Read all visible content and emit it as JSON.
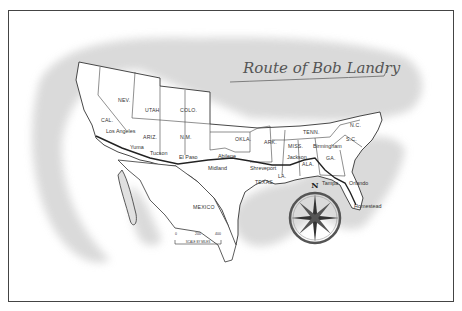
{
  "map": {
    "title": "Route of Bob Landry",
    "states": [
      {
        "label": "NEV.",
        "x": 118,
        "y": 102
      },
      {
        "label": "UTAH",
        "x": 145,
        "y": 112
      },
      {
        "label": "COLO.",
        "x": 180,
        "y": 112
      },
      {
        "label": "CAL.",
        "x": 101,
        "y": 122
      },
      {
        "label": "ARIZ.",
        "x": 143,
        "y": 139
      },
      {
        "label": "N.M.",
        "x": 180,
        "y": 139
      },
      {
        "label": "OKLA.",
        "x": 235,
        "y": 141
      },
      {
        "label": "ARK.",
        "x": 264,
        "y": 144
      },
      {
        "label": "TENN.",
        "x": 303,
        "y": 134
      },
      {
        "label": "N.C.",
        "x": 350,
        "y": 127
      },
      {
        "label": "MISS.",
        "x": 288,
        "y": 148
      },
      {
        "label": "S.C.",
        "x": 346,
        "y": 141
      },
      {
        "label": "GA.",
        "x": 326,
        "y": 160
      },
      {
        "label": "ALA.",
        "x": 302,
        "y": 166
      },
      {
        "label": "LA.",
        "x": 278,
        "y": 178
      },
      {
        "label": "TEXAS",
        "x": 255,
        "y": 184
      },
      {
        "label": "MEXICO",
        "x": 193,
        "y": 209
      }
    ],
    "cities": [
      {
        "label": "Los Angeles",
        "x": 106,
        "y": 133
      },
      {
        "label": "Yuma",
        "x": 130,
        "y": 149
      },
      {
        "label": "Tucson",
        "x": 150,
        "y": 155
      },
      {
        "label": "El Paso",
        "x": 179,
        "y": 159
      },
      {
        "label": "Abilene",
        "x": 218,
        "y": 158
      },
      {
        "label": "Midland",
        "x": 208,
        "y": 170
      },
      {
        "label": "Shreveport",
        "x": 250,
        "y": 170
      },
      {
        "label": "Jackson",
        "x": 287,
        "y": 159
      },
      {
        "label": "Birmingham",
        "x": 313,
        "y": 148
      },
      {
        "label": "Tampa",
        "x": 322,
        "y": 185
      },
      {
        "label": "Orlando",
        "x": 349,
        "y": 185
      },
      {
        "label": "Homestead",
        "x": 354,
        "y": 208
      }
    ],
    "scale": {
      "label": "SCALE BY MILES",
      "ticks": [
        "0",
        "200",
        "400"
      ]
    },
    "compass": {
      "north_label": "N"
    },
    "colors": {
      "frame": "#444444",
      "wash": "#d9d9d9",
      "land": "#ffffff",
      "lines": "#333333",
      "title": "#555555"
    }
  }
}
